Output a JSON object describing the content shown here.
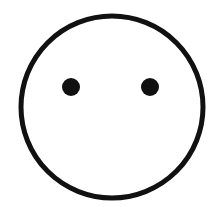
{
  "figure": {
    "background": "#ffffff",
    "stroke_color": "#111111",
    "head": {
      "cx": 112,
      "cy": 107,
      "r": 91,
      "stroke_width": 5
    },
    "eyes": [
      {
        "cx": 71,
        "cy": 87,
        "r": 9
      },
      {
        "cx": 150,
        "cy": 87,
        "r": 9
      }
    ]
  }
}
